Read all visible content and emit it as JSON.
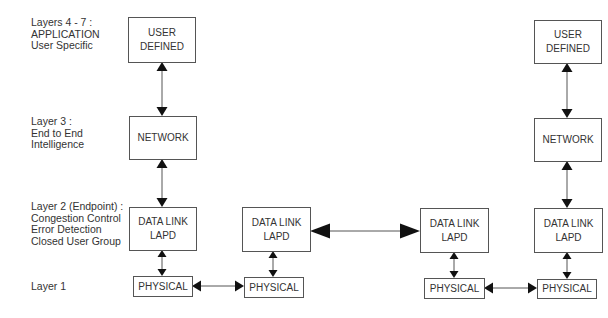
{
  "colors": {
    "background": "#ffffff",
    "box_stroke": "#555555",
    "text": "#333333",
    "arrowhead": "#111111"
  },
  "layer_labels": [
    {
      "id": "layers-4-7",
      "lines": [
        "Layers  4 - 7 :",
        "APPLICATION",
        "User Specific"
      ],
      "x": 31,
      "y": 26
    },
    {
      "id": "layer-3",
      "lines": [
        "Layer 3  :",
        "End to End",
        "Intelligence"
      ],
      "x": 31,
      "y": 125
    },
    {
      "id": "layer-2",
      "lines": [
        "Layer 2 (Endpoint) :",
        "Congestion Control",
        "Error Detection",
        "Closed User Group"
      ],
      "x": 31,
      "y": 210
    },
    {
      "id": "layer-1",
      "lines": [
        "Layer 1"
      ],
      "x": 31,
      "y": 290
    }
  ],
  "boxes": [
    {
      "id": "user-defined-left",
      "lines": [
        "USER",
        "DEFINED"
      ],
      "x": 128,
      "y": 17,
      "w": 67,
      "h": 45
    },
    {
      "id": "network-left",
      "lines": [
        "NETWORK"
      ],
      "x": 129,
      "y": 116,
      "w": 67,
      "h": 43
    },
    {
      "id": "data-link-1",
      "lines": [
        "DATA  LINK",
        "LAPD"
      ],
      "x": 129,
      "y": 207,
      "w": 67,
      "h": 43
    },
    {
      "id": "physical-1",
      "lines": [
        "PHYSICAL"
      ],
      "x": 133,
      "y": 276,
      "w": 59,
      "h": 20
    },
    {
      "id": "data-link-2",
      "lines": [
        "DATA  LINK",
        "LAPD"
      ],
      "x": 242,
      "y": 207,
      "w": 68,
      "h": 44
    },
    {
      "id": "physical-2",
      "lines": [
        "PHYSICAL"
      ],
      "x": 244,
      "y": 277,
      "w": 59,
      "h": 20
    },
    {
      "id": "data-link-3",
      "lines": [
        "DATA  LINK",
        "LAPD"
      ],
      "x": 420,
      "y": 208,
      "w": 68,
      "h": 44
    },
    {
      "id": "physical-3",
      "lines": [
        "PHYSICAL"
      ],
      "x": 424,
      "y": 278,
      "w": 60,
      "h": 20
    },
    {
      "id": "user-defined-right",
      "lines": [
        "USER",
        "DEFINED"
      ],
      "x": 534,
      "y": 20,
      "w": 67,
      "h": 43
    },
    {
      "id": "network-right",
      "lines": [
        "NETWORK"
      ],
      "x": 534,
      "y": 118,
      "w": 67,
      "h": 43
    },
    {
      "id": "data-link-4",
      "lines": [
        "DATA  LINK",
        "LAPD"
      ],
      "x": 534,
      "y": 208,
      "w": 68,
      "h": 44
    },
    {
      "id": "physical-4",
      "lines": [
        "PHYSICAL"
      ],
      "x": 537,
      "y": 279,
      "w": 59,
      "h": 19
    }
  ],
  "connectors": [
    {
      "id": "user-network-left",
      "orient": "v",
      "x": 162,
      "a": 62,
      "b": 116,
      "size": "small"
    },
    {
      "id": "network-datalink-left",
      "orient": "v",
      "x": 162,
      "a": 159,
      "b": 207,
      "size": "small"
    },
    {
      "id": "datalink-physical-1",
      "orient": "v",
      "x": 162,
      "a": 250,
      "b": 276,
      "size": "tiny"
    },
    {
      "id": "physical-1-2",
      "orient": "h",
      "y": 286,
      "a": 192,
      "b": 244,
      "size": "small"
    },
    {
      "id": "datalink-physical-2",
      "orient": "v",
      "x": 273,
      "a": 251,
      "b": 277,
      "size": "tiny"
    },
    {
      "id": "datalink-2-3",
      "orient": "h",
      "y": 231,
      "a": 310,
      "b": 420,
      "size": "large"
    },
    {
      "id": "datalink-physical-3",
      "orient": "v",
      "x": 454,
      "a": 252,
      "b": 278,
      "size": "tiny"
    },
    {
      "id": "physical-3-4",
      "orient": "h",
      "y": 288,
      "a": 484,
      "b": 537,
      "size": "small"
    },
    {
      "id": "user-network-right",
      "orient": "v",
      "x": 567,
      "a": 63,
      "b": 118,
      "size": "small"
    },
    {
      "id": "network-datalink-right",
      "orient": "v",
      "x": 567,
      "a": 161,
      "b": 208,
      "size": "small"
    },
    {
      "id": "datalink-physical-4",
      "orient": "v",
      "x": 567,
      "a": 252,
      "b": 279,
      "size": "tiny"
    }
  ]
}
